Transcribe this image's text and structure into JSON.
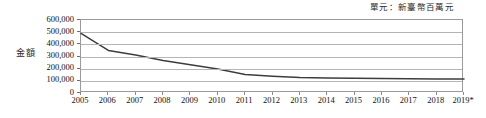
{
  "chart_data": {
    "type": "line",
    "title": "",
    "unit_caption": "單元：新臺幣百萬元",
    "ylabel": "金額",
    "xlabel": "",
    "grid": true,
    "legend": false,
    "ylim": [
      0,
      600000
    ],
    "y_ticks": [
      "0",
      "100,000",
      "200,000",
      "300,000",
      "400,000",
      "500,000",
      "600,000"
    ],
    "y_tick_values": [
      0,
      100000,
      200000,
      300000,
      400000,
      500000,
      600000
    ],
    "categories": [
      "2005",
      "2006",
      "2007",
      "2008",
      "2009",
      "2010",
      "2011",
      "2012",
      "2013",
      "2014",
      "2015",
      "2016",
      "2017",
      "2018",
      "2019*"
    ],
    "values": [
      490000,
      350000,
      312000,
      268000,
      232000,
      198000,
      152000,
      138000,
      128000,
      124000,
      121000,
      119000,
      117000,
      116000,
      115000
    ],
    "series": [
      {
        "name": "金額",
        "color": "#3d3d3d",
        "values": [
          490000,
          350000,
          312000,
          268000,
          232000,
          198000,
          152000,
          138000,
          128000,
          124000,
          121000,
          119000,
          117000,
          116000,
          115000
        ]
      }
    ],
    "footnote_marker": "*"
  },
  "colors": {
    "line": "#3d3d3d",
    "grid": "#b5b5b5",
    "frame": "#9a9a9a",
    "text": "#111111",
    "background": "#ffffff"
  }
}
